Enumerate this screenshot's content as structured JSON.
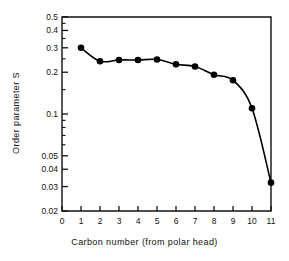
{
  "chart_data": {
    "type": "scatter",
    "title": "",
    "xlabel": "Carbon number (from polar head)",
    "ylabel": "Order parameter S",
    "xlim": [
      0,
      11
    ],
    "ylim": [
      0.02,
      0.5
    ],
    "yscale": "log",
    "xscale": "linear",
    "grid": false,
    "legend": null,
    "x": [
      1,
      2,
      3,
      4,
      5,
      6,
      7,
      8,
      9,
      10,
      11
    ],
    "values": [
      0.3,
      0.24,
      0.245,
      0.245,
      0.247,
      0.228,
      0.22,
      0.192,
      0.175,
      0.11,
      0.032
    ],
    "series": [
      {
        "name": "Order parameter S",
        "x": [
          1,
          2,
          3,
          4,
          5,
          6,
          7,
          8,
          9,
          10,
          11
        ],
        "values": [
          0.3,
          0.24,
          0.245,
          0.245,
          0.247,
          0.228,
          0.22,
          0.192,
          0.175,
          0.11,
          0.032
        ],
        "marker": "filled-circle",
        "color": "#000000",
        "line": "smooth-fit-curve"
      }
    ],
    "xticks": [
      0,
      1,
      2,
      3,
      4,
      5,
      6,
      7,
      8,
      9,
      10,
      11
    ],
    "xticklabels": [
      "0",
      "1",
      "2",
      "3",
      "4",
      "5",
      "6",
      "7",
      "8",
      "9",
      "10",
      "11"
    ],
    "yticks": [
      0.02,
      0.03,
      0.04,
      0.05,
      0.1,
      0.2,
      0.3,
      0.4,
      0.5
    ],
    "yticklabels": [
      "0.02",
      "0.03",
      "0.04",
      "0.05",
      "0.1",
      "0.2",
      "0.3",
      "0.4",
      "0.5"
    ],
    "yminorticks": [
      0.06,
      0.07,
      0.08,
      0.09,
      0.15,
      0.25,
      0.35,
      0.45
    ],
    "colors": {
      "axis": "#111111",
      "marker": "#000000",
      "curve": "#000000",
      "background": "#ffffff"
    }
  }
}
